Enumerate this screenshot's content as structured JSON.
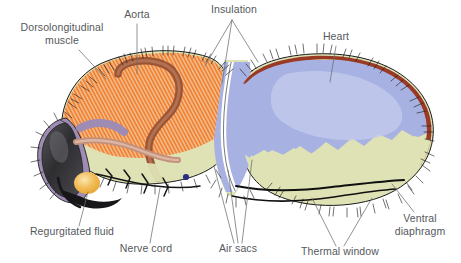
{
  "figure": {
    "kind": "anatomical-cross-section",
    "background_color": "#ffffff",
    "label_color": "#55585c",
    "leader_color": "#6a6d70"
  },
  "labels": [
    {
      "id": "dorsolongitudinal-muscle",
      "text": "Dorsolongitudinal",
      "text2": "muscle",
      "x": 62,
      "y": 31,
      "align": "middle"
    },
    {
      "id": "aorta",
      "text": "Aorta",
      "x": 137,
      "y": 18,
      "align": "middle"
    },
    {
      "id": "insulation",
      "text": "Insulation",
      "x": 234,
      "y": 13,
      "align": "middle"
    },
    {
      "id": "heart",
      "text": "Heart",
      "x": 336,
      "y": 40,
      "align": "middle"
    },
    {
      "id": "ventral-diaphragm",
      "text": "Ventral",
      "text2": "diaphragm",
      "x": 420,
      "y": 222,
      "align": "middle"
    },
    {
      "id": "thermal-window",
      "text": "Thermal window",
      "x": 340,
      "y": 255,
      "align": "middle"
    },
    {
      "id": "air-sacs",
      "text": "Air sacs",
      "x": 238,
      "y": 252,
      "align": "middle"
    },
    {
      "id": "nerve-cord",
      "text": "Nerve cord",
      "x": 146,
      "y": 252,
      "align": "middle"
    },
    {
      "id": "regurgitated-fluid",
      "text": "Regurgitated fluid",
      "x": 72,
      "y": 235,
      "align": "middle"
    }
  ],
  "anatomy": {
    "body_cuticle": {
      "name": "body-cuticle",
      "color": "#dee2b4"
    },
    "thorax_muscle_base": {
      "name": "dorsolongitudinal-muscle",
      "color": "#f2b07a"
    },
    "thorax_muscle_stripe": {
      "name": "muscle-striation",
      "color": "#ef7f2e"
    },
    "aorta_tube": {
      "name": "aorta",
      "color": "#9b5536"
    },
    "heart_band": {
      "name": "heart",
      "color": "#9b3a23"
    },
    "air_sac": {
      "name": "air-sac",
      "color": "#a7b2e2"
    },
    "air_sac_light": {
      "name": "air-sac-highlight",
      "color": "#c3cbec"
    },
    "air_sac_channel": {
      "name": "petiole-air-channel",
      "color": "#ffffff"
    },
    "head_eye": {
      "name": "compound-eye",
      "color": "#3a3a3c"
    },
    "head_rim": {
      "name": "head-cuticle",
      "color": "#9f8cb4"
    },
    "droplet": {
      "name": "regurgitated-fluid-droplet",
      "color": "#f0b44a"
    },
    "nerve_cord": {
      "name": "nerve-cord",
      "color": "#1a1a1a"
    },
    "ventral_diaphragm": {
      "name": "ventral-diaphragm",
      "color": "#101010"
    },
    "hairs": {
      "name": "insulating-hairs",
      "color": "#1a1a1a"
    },
    "ganglion_dot": {
      "name": "ganglion",
      "color": "#2a2f86"
    }
  }
}
